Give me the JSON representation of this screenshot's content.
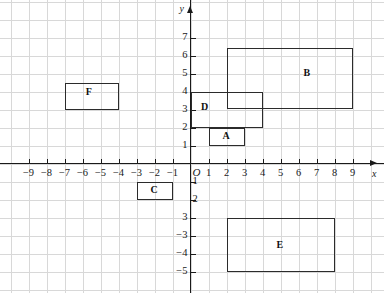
{
  "chart_data": {
    "type": "scatter",
    "title": "",
    "xlabel": "x",
    "ylabel": "y",
    "grid": true,
    "legend": "none",
    "xlim": [
      -10,
      10
    ],
    "ylim": [
      -7,
      8
    ],
    "x_ticks": [
      -9,
      -8,
      -7,
      -6,
      -5,
      -4,
      -3,
      -2,
      -1,
      1,
      2,
      3,
      4,
      5,
      6,
      7,
      8,
      9
    ],
    "y_ticks": [
      7,
      6,
      5,
      4,
      3,
      2,
      1,
      -1,
      -2,
      -3,
      -4,
      -5,
      -6
    ],
    "x_tick_labels": [
      "−9",
      "−8",
      "−7",
      "−6",
      "−5",
      "−4",
      "−3",
      "−2",
      "−1",
      "1",
      "2",
      "3",
      "4",
      "5",
      "6",
      "7",
      "8",
      "9"
    ],
    "y_tick_labels": [
      "7",
      "6",
      "5",
      "4",
      "3",
      "2",
      "1",
      "1",
      "2",
      "3",
      "−3",
      "−4",
      "−5",
      "−6"
    ],
    "origin_label": "O",
    "unit_px": 18,
    "rectangles": [
      {
        "label": "A",
        "x0": 1,
        "y0": 1,
        "x1": 3,
        "y1": 2
      },
      {
        "label": "B",
        "x0": 2,
        "y0": 3,
        "x1": 9,
        "y1": 6.4
      },
      {
        "label": "C",
        "x0": -3,
        "y0": -2,
        "x1": -1,
        "y1": -1
      },
      {
        "label": "D",
        "x0": 0,
        "y0": 2,
        "x1": 4,
        "y1": 4
      },
      {
        "label": "E",
        "x0": 2,
        "y0": -6,
        "x1": 8,
        "y1": -3
      },
      {
        "label": "F",
        "x0": -7,
        "y0": 3,
        "x1": -4,
        "y1": 4.5
      }
    ],
    "label_positions": [
      {
        "label": "A",
        "x": 2.0,
        "y": 1.45
      },
      {
        "label": "B",
        "x": 6.5,
        "y": 5.0
      },
      {
        "label": "C",
        "x": -2.0,
        "y": -1.5
      },
      {
        "label": "D",
        "x": 0.8,
        "y": 3.1
      },
      {
        "label": "E",
        "x": 5.0,
        "y": -4.6
      },
      {
        "label": "F",
        "x": -5.6,
        "y": 3.9
      }
    ]
  },
  "colors": {
    "grid": "#d8d8d8",
    "axis": "#1a1a1a",
    "shape_stroke": "#2b2b2b",
    "text": "#111111",
    "background": "#ffffff"
  }
}
